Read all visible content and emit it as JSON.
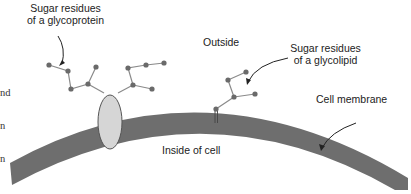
{
  "labels": {
    "glycoprotein": [
      "Sugar residues",
      "of a glycoprotein"
    ],
    "outside": "Outside",
    "glycolipid": [
      "Sugar residues",
      "of a glycolipid"
    ],
    "membrane": "Cell membrane",
    "inside": "Inside of cell",
    "cutoff_text": [
      "nd",
      "n",
      "n"
    ]
  },
  "colors": {
    "membrane": "#6e6e6e",
    "protein_fill": "#d6d6d6",
    "sugar_node": "#6a6a6a",
    "sugar_bond": "#8a8a8a",
    "text": "#222222"
  }
}
